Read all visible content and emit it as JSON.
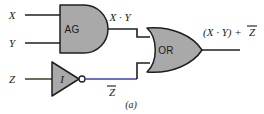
{
  "figure": {
    "caption": "(a)",
    "background_color": "#ffffff"
  },
  "colors": {
    "gate_fill": "#a9a9a9",
    "gate_outline": "#1f1f1f",
    "wire": "#1f1f1f",
    "wire_inverted_highlight": "#3a3fb5",
    "wire_z_input": "#4a4a28",
    "text": "#1a1a1a",
    "bubble_fill": "#ffffff"
  },
  "inputs": [
    {
      "id": "x",
      "label": "X"
    },
    {
      "id": "y",
      "label": "Y"
    },
    {
      "id": "z",
      "label": "Z"
    }
  ],
  "gates": [
    {
      "id": "and-gate",
      "type": "AND",
      "label": "AG"
    },
    {
      "id": "inverter-gate",
      "type": "NOT",
      "label": "I"
    },
    {
      "id": "or-gate",
      "type": "OR",
      "label": "OR"
    }
  ],
  "signals": {
    "and_output": {
      "base": "X · Y",
      "overbar": ""
    },
    "inverter_output": {
      "base": "Z",
      "overbar": "Z"
    },
    "circuit_output": {
      "prefix": "(X · Y) + ",
      "overbar": "Z"
    }
  },
  "labels": {
    "input_x": "X",
    "input_y": "Y",
    "input_z": "Z",
    "and_gate": "AG",
    "inverter_gate": "I",
    "or_gate": "OR",
    "and_output": "X · Y",
    "inverted_z": "Z",
    "output_prefix": "(X · Y) + ",
    "output_overbar_term": "Z",
    "caption": "(a)"
  }
}
